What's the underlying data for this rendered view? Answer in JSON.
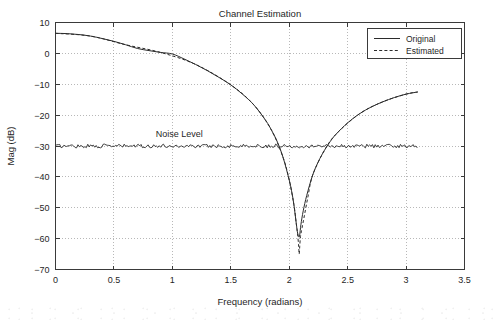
{
  "chart_data": {
    "type": "line",
    "title": "Channel Estimation",
    "xlabel": "Frequency (radians)",
    "ylabel": "Mag (dB)",
    "xlim": [
      0,
      3.5
    ],
    "ylim": [
      -70,
      10
    ],
    "grid": true,
    "xticks": [
      "0",
      "0.5",
      "1",
      "1.5",
      "2",
      "2.5",
      "3",
      "3.5"
    ],
    "xtick_values": [
      0,
      0.5,
      1,
      1.5,
      2,
      2.5,
      3,
      3.5
    ],
    "yticks": [
      "10",
      "0",
      "−10",
      "−20",
      "−30",
      "−40",
      "−50",
      "−60",
      "−70"
    ],
    "ytick_values": [
      10,
      0,
      -10,
      -20,
      -30,
      -40,
      -50,
      -60,
      -70
    ],
    "legend_position": "upper right",
    "annotations": [
      {
        "text": "Noise Level",
        "x": 1.06,
        "y": -27.0
      }
    ],
    "series": [
      {
        "name": "Original",
        "style": "solid",
        "color": "#2b2b2b",
        "x": [
          0,
          0.1,
          0.2,
          0.3,
          0.4,
          0.5,
          0.6,
          0.7,
          0.8,
          0.9,
          1.0,
          1.1,
          1.2,
          1.3,
          1.4,
          1.5,
          1.6,
          1.7,
          1.8,
          1.85,
          1.9,
          1.95,
          2.0,
          2.02,
          2.04,
          2.06,
          2.07,
          2.08,
          2.085,
          2.09,
          2.1,
          2.12,
          2.15,
          2.2,
          2.25,
          2.3,
          2.35,
          2.4,
          2.5,
          2.6,
          2.7,
          2.8,
          2.9,
          3.0,
          3.1
        ],
        "y": [
          6.5,
          6.4,
          6.1,
          5.6,
          4.8,
          3.9,
          2.8,
          1.6,
          0.9,
          0.3,
          -0.2,
          -1.8,
          -3.6,
          -5.6,
          -7.8,
          -10.2,
          -13.2,
          -16.8,
          -21.8,
          -25.0,
          -28.8,
          -34.0,
          -41.0,
          -44.5,
          -49.0,
          -55.0,
          -57.8,
          -59.2,
          -59.5,
          -58.8,
          -55.5,
          -51.0,
          -46.0,
          -39.5,
          -35.0,
          -31.5,
          -28.6,
          -26.2,
          -22.5,
          -19.6,
          -17.4,
          -15.7,
          -14.3,
          -13.2,
          -12.5
        ]
      },
      {
        "name": "Estimated",
        "style": "dashed",
        "color": "#2b2b2b",
        "x": [
          0,
          0.3,
          0.6,
          0.9,
          1.2,
          1.5,
          1.7,
          1.85,
          1.95,
          2.0,
          2.04,
          2.06,
          2.07,
          2.08,
          2.085,
          2.09,
          2.095,
          2.1,
          2.11,
          2.13,
          2.16,
          2.2,
          2.3,
          2.4,
          2.6,
          2.8,
          3.0,
          3.1
        ],
        "y": [
          6.5,
          5.6,
          2.8,
          0.3,
          -3.6,
          -10.2,
          -16.8,
          -25.0,
          -34.0,
          -41.0,
          -49.0,
          -55.0,
          -58.0,
          -62.0,
          -65.0,
          -62.5,
          -59.8,
          -58.5,
          -56.5,
          -52.5,
          -46.5,
          -39.5,
          -31.5,
          -26.2,
          -19.6,
          -15.7,
          -13.2,
          -12.5
        ]
      },
      {
        "name": "Noise Level",
        "style": "solid-noisy",
        "color": "#2b2b2b",
        "level": -30,
        "x_start": 0,
        "x_end": 3.1
      }
    ],
    "legend": [
      {
        "label": "Original",
        "style": "solid"
      },
      {
        "label": "Estimated",
        "style": "dashed"
      }
    ]
  }
}
